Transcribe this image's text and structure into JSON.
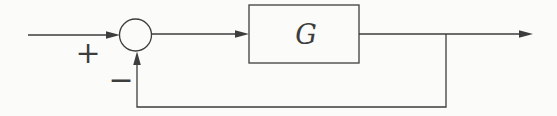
{
  "diagram": {
    "block": {
      "label": "G"
    },
    "summing_junction": {
      "plus_label": "+",
      "minus_label": "−"
    },
    "colors": {
      "line": "#3d3d3d",
      "background": "#fbfbfa"
    }
  }
}
